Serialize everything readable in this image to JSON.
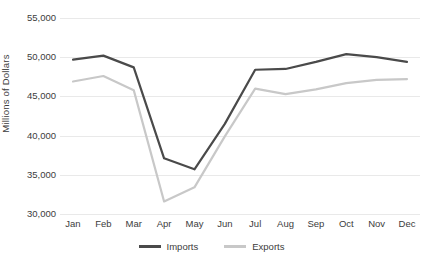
{
  "chart_data": {
    "type": "line",
    "title": "",
    "xlabel": "",
    "ylabel": "Millions of Dollars",
    "categories": [
      "Jan",
      "Feb",
      "Mar",
      "Apr",
      "May",
      "Jun",
      "Jul",
      "Aug",
      "Sep",
      "Oct",
      "Nov",
      "Dec"
    ],
    "ylim": [
      30000,
      55000
    ],
    "yticks": [
      30000,
      35000,
      40000,
      45000,
      50000,
      55000
    ],
    "ytick_labels": [
      "30,000",
      "35,000",
      "40,000",
      "45,000",
      "50,000",
      "55,000"
    ],
    "grid": "horizontal",
    "legend_position": "bottom",
    "series": [
      {
        "name": "Imports",
        "color": "#4a4a4a",
        "values": [
          49700,
          50200,
          48700,
          37100,
          35700,
          41500,
          48400,
          48500,
          49400,
          50400,
          50000,
          49400
        ]
      },
      {
        "name": "Exports",
        "color": "#c8c8c8",
        "values": [
          46900,
          47600,
          45800,
          31600,
          33400,
          39900,
          46000,
          45300,
          45900,
          46700,
          47100,
          47200
        ]
      }
    ]
  }
}
